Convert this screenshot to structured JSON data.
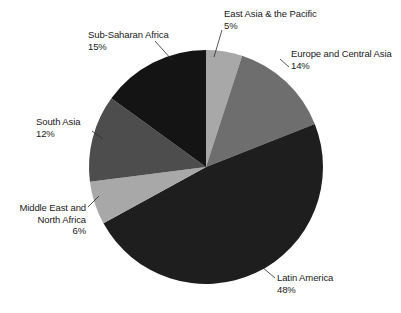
{
  "chart_data": {
    "type": "pie",
    "title": "",
    "subtitle": "",
    "xlabel": "",
    "ylabel": "",
    "legend_position": "none",
    "grid": false,
    "start_angle_deg": 0,
    "direction": "clockwise",
    "units": "percent",
    "total": 100,
    "categories": [
      "East Asia & the Pacific",
      "Europe and Central Asia",
      "Latin America",
      "Middle East and North Africa",
      "South Asia",
      "Sub-Saharan Africa"
    ],
    "values": [
      5,
      14,
      48,
      6,
      12,
      15
    ],
    "slices": [
      {
        "name": "east-asia-pacific",
        "label": "East Asia & the Pacific",
        "value": 5,
        "value_text": "5%",
        "color": "#a8a8a8",
        "start_deg": 0,
        "end_deg": 18
      },
      {
        "name": "europe-central-asia",
        "label": "Europe and Central Asia",
        "value": 14,
        "value_text": "14%",
        "color": "#6e6e6e",
        "start_deg": 18,
        "end_deg": 68.4
      },
      {
        "name": "latin-america",
        "label": "Latin America",
        "value": 48,
        "value_text": "48%",
        "color": "#1e1e1e",
        "start_deg": 68.4,
        "end_deg": 241.2
      },
      {
        "name": "middle-east-north-africa",
        "label": "Middle East and North Africa",
        "value": 6,
        "value_text": "6%",
        "color": "#a8a8a8",
        "start_deg": 241.2,
        "end_deg": 262.8
      },
      {
        "name": "south-asia",
        "label": "South Asia",
        "value": 12,
        "value_text": "12%",
        "color": "#4d4d4d",
        "start_deg": 262.8,
        "end_deg": 306
      },
      {
        "name": "sub-saharan-africa",
        "label": "Sub-Saharan Africa",
        "value": 15,
        "value_text": "15%",
        "color": "#141414",
        "start_deg": 306,
        "end_deg": 360
      }
    ]
  },
  "labels": {
    "east_asia": {
      "name": "East Asia & the Pacific",
      "pct": "5%"
    },
    "europe": {
      "name": "Europe and Central Asia",
      "pct": "14%"
    },
    "sub_saharan": {
      "name": "Sub-Saharan Africa",
      "pct": "15%"
    },
    "south_asia": {
      "name": "South Asia",
      "pct": "12%"
    },
    "middle_east": {
      "line1": "Middle East and",
      "line2": "North Africa",
      "pct": "6%"
    },
    "latin_america": {
      "name": "Latin America",
      "pct": "48%"
    }
  }
}
